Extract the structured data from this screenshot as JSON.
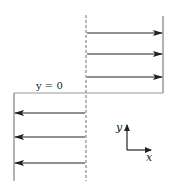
{
  "diagram": {
    "title": "",
    "colors": {
      "arrow": "#222222",
      "wall": "#9a9a9a",
      "dashed": "#8a8a8a",
      "text": "#222222"
    },
    "boundary_label": "y = 0",
    "axes": {
      "x_label": "x",
      "y_label": "y"
    },
    "upper_arrows": {
      "direction": "right",
      "count": 3,
      "y_positions": [
        33,
        54,
        77
      ],
      "x_start": 87,
      "x_end": 162
    },
    "lower_arrows": {
      "direction": "left",
      "count": 3,
      "y_positions": [
        113,
        137,
        163
      ],
      "x_start": 85,
      "x_end": 15
    },
    "dashed_line": {
      "x": 86,
      "y_top": 15,
      "y_bottom": 181
    },
    "right_wall": {
      "x": 163,
      "y_top": 16,
      "y_bottom": 93
    },
    "left_wall": {
      "x": 14,
      "y_top": 93,
      "y_bottom": 181
    },
    "boundary_line": {
      "y": 93,
      "x_left": 14,
      "x_right": 163
    }
  }
}
